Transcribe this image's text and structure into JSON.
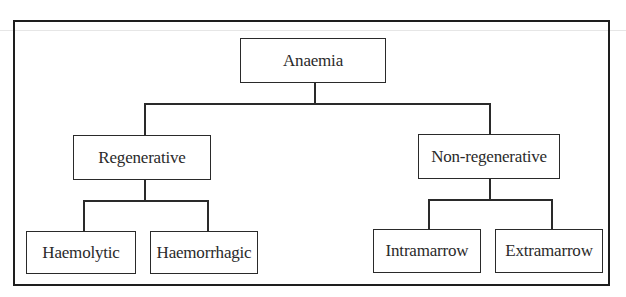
{
  "diagram": {
    "type": "tree",
    "root": {
      "label": "Anaemia",
      "children": [
        {
          "label": "Regenerative",
          "children": [
            {
              "label": "Haemolytic"
            },
            {
              "label": "Haemorrhagic"
            }
          ]
        },
        {
          "label": "Non-regenerative",
          "children": [
            {
              "label": "Intramarrow"
            },
            {
              "label": "Extramarrow"
            }
          ]
        }
      ]
    }
  },
  "colors": {
    "line": "#2a2a2a",
    "frame": "#1e1e1e",
    "background": "#ffffff"
  }
}
